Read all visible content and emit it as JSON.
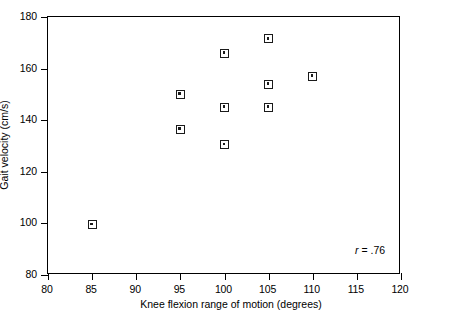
{
  "chart_data": {
    "type": "scatter",
    "title": "",
    "xlabel": "Knee flexion range of motion (degrees)",
    "ylabel": "Gait velocity (cm/s)",
    "xlim": [
      80,
      120
    ],
    "ylim": [
      80,
      180
    ],
    "xticks": [
      80,
      85,
      90,
      95,
      100,
      105,
      110,
      115,
      120
    ],
    "xtick_labels": [
      "80",
      "85",
      "90",
      "95",
      "100",
      "105",
      "110",
      "115",
      "120"
    ],
    "yticks": [
      80,
      100,
      120,
      140,
      160,
      180
    ],
    "ytick_labels": [
      "80",
      "100",
      "120",
      "140",
      "160",
      "180"
    ],
    "grid": false,
    "legend": null,
    "marker_style": "open-square-with-center-dot",
    "marker_color": "#1a1a1a",
    "points": [
      {
        "x": 85,
        "y": 99.5
      },
      {
        "x": 95,
        "y": 150
      },
      {
        "x": 95,
        "y": 136.5
      },
      {
        "x": 100,
        "y": 166
      },
      {
        "x": 100,
        "y": 145
      },
      {
        "x": 100,
        "y": 130.5
      },
      {
        "x": 105,
        "y": 171.5
      },
      {
        "x": 105,
        "y": 154
      },
      {
        "x": 105,
        "y": 145
      },
      {
        "x": 110,
        "y": 157
      }
    ],
    "annotations": [
      {
        "name": "correlation",
        "symbol": "r",
        "separator": " = ",
        "value": ".76",
        "text": "r = .76",
        "x": 118.2,
        "y": 89.5
      }
    ]
  }
}
